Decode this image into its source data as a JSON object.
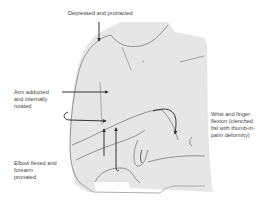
{
  "diagram": {
    "colors": {
      "background": "#ffffff",
      "body_fill": "#e6e6e6",
      "outline": "#888888",
      "arrow": "#333333",
      "text": "#444444"
    },
    "labels": {
      "shoulder": "Depressed and protracted",
      "arm": "Arm adducted\nand internally\nrotated",
      "elbow": "Elbow flexed and\nforearm\npronated",
      "wrist": "Wrist and finger\nflexion (clenched\nfist with thumb-in-\npalm deformity)"
    },
    "arrows": [
      {
        "name": "shoulder-depression-arrow",
        "direction": "down"
      },
      {
        "name": "arm-internal-rotation-arrow",
        "direction": "right"
      },
      {
        "name": "arm-rotation-curl-arrow",
        "direction": "curved-right"
      },
      {
        "name": "elbow-flexion-arrow",
        "direction": "up"
      },
      {
        "name": "forearm-pronation-arrow",
        "direction": "up-curl"
      },
      {
        "name": "wrist-flexion-arrow",
        "direction": "curved-down"
      }
    ]
  }
}
